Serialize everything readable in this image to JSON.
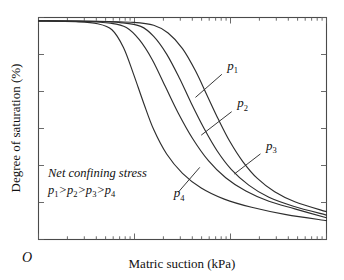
{
  "figure": {
    "origin_label": "O",
    "annotation": {
      "line1": "Net confining stress",
      "line2_parts": [
        "p",
        "1",
        ">p",
        "2",
        ">p",
        "3",
        ">p",
        "4"
      ],
      "line2_plain": "p1>p2>p3>p4"
    }
  },
  "chart_data": {
    "type": "line",
    "title": "",
    "xlabel": "Matric suction (kPa)",
    "ylabel": "Degree of saturation (%)",
    "xscale": "log",
    "yscale": "linear",
    "grid": false,
    "axis_tick_labels_shown": false,
    "legend_position": "inline-curve-labels",
    "xlim": [
      0,
      1
    ],
    "ylim": [
      0,
      1
    ],
    "annotations": [
      {
        "text": "Net confining stress",
        "x": 0.09,
        "y": 0.3
      },
      {
        "text": "p1>p2>p3>p4",
        "x": 0.09,
        "y": 0.23
      }
    ],
    "series": [
      {
        "name": "p1",
        "label": "p1",
        "label_sub": "1",
        "description": "Highest net confining stress: largest air-entry value, curve desaturates last",
        "air_entry_x": 0.4,
        "points_xy": [
          [
            0.0,
            0.985
          ],
          [
            0.2,
            0.983
          ],
          [
            0.33,
            0.978
          ],
          [
            0.4,
            0.965
          ],
          [
            0.45,
            0.93
          ],
          [
            0.5,
            0.86
          ],
          [
            0.545,
            0.76
          ],
          [
            0.585,
            0.65
          ],
          [
            0.625,
            0.54
          ],
          [
            0.665,
            0.44
          ],
          [
            0.71,
            0.35
          ],
          [
            0.76,
            0.275
          ],
          [
            0.82,
            0.215
          ],
          [
            0.89,
            0.17
          ],
          [
            1.0,
            0.125
          ]
        ]
      },
      {
        "name": "p2",
        "label": "p2",
        "label_sub": "2",
        "description": "Second highest net confining stress",
        "air_entry_x": 0.355,
        "points_xy": [
          [
            0.0,
            0.985
          ],
          [
            0.18,
            0.983
          ],
          [
            0.29,
            0.976
          ],
          [
            0.355,
            0.96
          ],
          [
            0.4,
            0.915
          ],
          [
            0.445,
            0.835
          ],
          [
            0.49,
            0.725
          ],
          [
            0.53,
            0.615
          ],
          [
            0.575,
            0.5
          ],
          [
            0.62,
            0.4
          ],
          [
            0.67,
            0.315
          ],
          [
            0.73,
            0.245
          ],
          [
            0.8,
            0.19
          ],
          [
            0.885,
            0.15
          ],
          [
            1.0,
            0.11
          ]
        ]
      },
      {
        "name": "p3",
        "label": "p3",
        "label_sub": "3",
        "description": "Third net confining stress",
        "air_entry_x": 0.305,
        "points_xy": [
          [
            0.0,
            0.985
          ],
          [
            0.16,
            0.982
          ],
          [
            0.25,
            0.974
          ],
          [
            0.305,
            0.955
          ],
          [
            0.35,
            0.9
          ],
          [
            0.395,
            0.81
          ],
          [
            0.44,
            0.69
          ],
          [
            0.485,
            0.57
          ],
          [
            0.535,
            0.455
          ],
          [
            0.59,
            0.355
          ],
          [
            0.65,
            0.278
          ],
          [
            0.72,
            0.218
          ],
          [
            0.8,
            0.172
          ],
          [
            0.89,
            0.138
          ],
          [
            1.0,
            0.098
          ]
        ]
      },
      {
        "name": "p4",
        "label": "p4",
        "label_sub": "4",
        "description": "Lowest net confining stress: smallest air-entry value, desaturates first and most steeply",
        "air_entry_x": 0.255,
        "points_xy": [
          [
            0.0,
            0.985
          ],
          [
            0.13,
            0.981
          ],
          [
            0.205,
            0.972
          ],
          [
            0.255,
            0.945
          ],
          [
            0.295,
            0.865
          ],
          [
            0.33,
            0.745
          ],
          [
            0.365,
            0.615
          ],
          [
            0.4,
            0.495
          ],
          [
            0.445,
            0.385
          ],
          [
            0.5,
            0.298
          ],
          [
            0.565,
            0.232
          ],
          [
            0.645,
            0.182
          ],
          [
            0.74,
            0.145
          ],
          [
            0.86,
            0.112
          ],
          [
            1.0,
            0.085
          ]
        ]
      }
    ],
    "curve_labels": [
      {
        "series": "p1",
        "text_x": 0.655,
        "text_y": 0.765,
        "leader_to_x": 0.545,
        "leader_to_y": 0.64
      },
      {
        "series": "p2",
        "text_x": 0.69,
        "text_y": 0.595,
        "leader_to_x": 0.565,
        "leader_to_y": 0.47
      },
      {
        "series": "p3",
        "text_x": 0.79,
        "text_y": 0.405,
        "leader_to_x": 0.68,
        "leader_to_y": 0.295
      },
      {
        "series": "p4",
        "text_x": 0.47,
        "text_y": 0.19,
        "leader_to_x": 0.56,
        "leader_to_y": 0.325
      }
    ]
  }
}
